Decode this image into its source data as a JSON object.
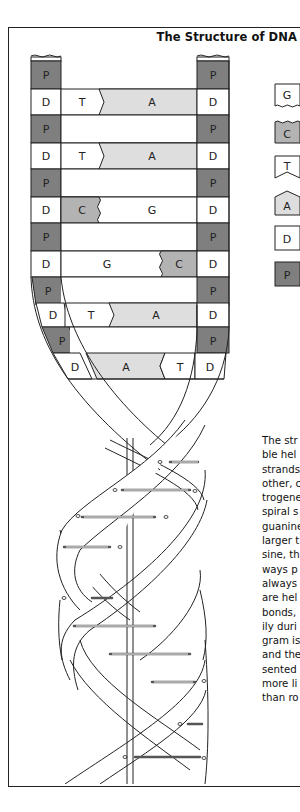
{
  "title": "The Structure of DNA",
  "colors": {
    "phosphate": "#7f7f7f",
    "deoxyribose": "#ffffff",
    "adenine": "#dedede",
    "thymine": "#ffffff",
    "guanine": "#ffffff",
    "cytosine": "#b3b3b3",
    "outline": "#222222"
  },
  "legend": [
    {
      "label": "G",
      "shape": "wavy-bottom",
      "name": "guanine"
    },
    {
      "label": "C",
      "shape": "wavy-top",
      "name": "cytosine"
    },
    {
      "label": "T",
      "shape": "notched-bottom",
      "name": "thymine"
    },
    {
      "label": "A",
      "shape": "pointed-top",
      "name": "adenine"
    },
    {
      "label": "D",
      "shape": "square",
      "name": "deoxyribose"
    },
    {
      "label": "P",
      "shape": "square",
      "name": "phosphate"
    }
  ],
  "ladder": {
    "left_strand": [
      "P",
      "D",
      "P",
      "D",
      "P",
      "D",
      "P",
      "D",
      "P",
      "D",
      "P",
      "D"
    ],
    "right_strand": [
      "P",
      "D",
      "P",
      "D",
      "P",
      "D",
      "P",
      "D",
      "P",
      "D",
      "P",
      "D"
    ],
    "base_pairs": [
      {
        "left": "T",
        "right": "A"
      },
      {
        "left": "T",
        "right": "A"
      },
      {
        "left": "C",
        "right": "G"
      },
      {
        "left": "G",
        "right": "C"
      },
      {
        "left": "T",
        "right": "A"
      },
      {
        "left": "A",
        "right": "T"
      }
    ]
  },
  "description_lines": [
    "The str",
    "ble hel",
    "strands",
    "other, c",
    "trogene",
    "spiral s",
    "guanine",
    "larger t",
    "sine, th",
    "ways p",
    "always",
    "are hel",
    "bonds,",
    "ily duri",
    "gram is",
    "and the",
    "sented",
    "more li",
    "than ro"
  ]
}
